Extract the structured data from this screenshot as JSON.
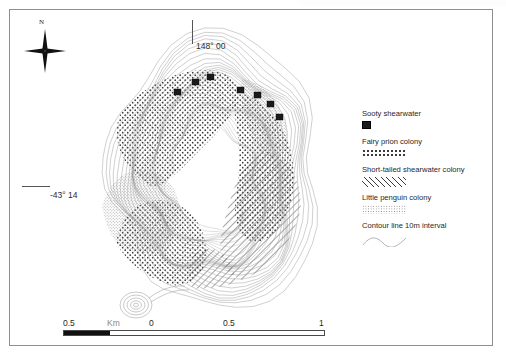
{
  "map": {
    "north_arrow_label": "N",
    "longitude_label": "148° 00",
    "latitude_label": "-43° 14"
  },
  "legend": {
    "entries": [
      {
        "label": "Sooty shearwater",
        "swatch": "black-square-symbol"
      },
      {
        "label": "Fairy prion colony",
        "swatch": "sparse-dot-pattern"
      },
      {
        "label": "Short-tailed shearwater colony",
        "swatch": "diagonal-hatch-pattern"
      },
      {
        "label": "Little penguin colony",
        "swatch": "fine-stipple-pattern"
      },
      {
        "label": "Contour line 10m interval",
        "swatch": "wavy-contour-line"
      }
    ]
  },
  "scale_bar": {
    "unit": "Km",
    "ticks": [
      "0.5",
      "Km",
      "0",
      "0.5",
      "1"
    ]
  },
  "colors": {
    "frame": "#8e8e8e",
    "contour": "#9a9a9a",
    "symbol": "#1b1b1b",
    "text": "#1f1f1f"
  }
}
